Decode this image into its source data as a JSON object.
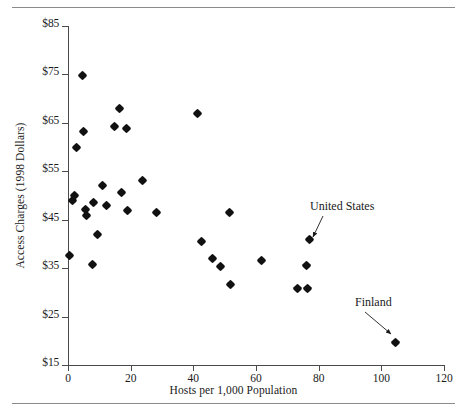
{
  "figure": {
    "has_top_rule": true,
    "has_bottom_rule": true,
    "background": "#ffffff",
    "marker_color": "#111111",
    "axis_color": "#4a4a4a",
    "rule_color": "#8a8a8a"
  },
  "chart_data": {
    "type": "scatter",
    "title": "",
    "xlabel": "Hosts per 1,000 Population",
    "ylabel": "Access Charges (1998 Dollars)",
    "xlim": [
      0,
      120
    ],
    "ylim": [
      15,
      85
    ],
    "xticks": [
      0,
      20,
      40,
      60,
      80,
      100,
      120
    ],
    "xtick_labels": [
      "0",
      "20",
      "40",
      "60",
      "80",
      "100",
      "120"
    ],
    "yticks": [
      15,
      25,
      35,
      45,
      55,
      65,
      75,
      85
    ],
    "ytick_labels": [
      "$15",
      "$25",
      "$35",
      "$45",
      "$55",
      "$65",
      "$75",
      "$85"
    ],
    "grid": false,
    "legend": null,
    "points": [
      {
        "x": 0.6,
        "y": 37.6
      },
      {
        "x": 1.3,
        "y": 48.9
      },
      {
        "x": 2.2,
        "y": 49.9
      },
      {
        "x": 2.6,
        "y": 60.0
      },
      {
        "x": 4.7,
        "y": 74.8
      },
      {
        "x": 5.1,
        "y": 63.2
      },
      {
        "x": 5.6,
        "y": 47.2
      },
      {
        "x": 5.8,
        "y": 45.9
      },
      {
        "x": 7.7,
        "y": 35.8
      },
      {
        "x": 8.0,
        "y": 48.5
      },
      {
        "x": 9.5,
        "y": 42.0
      },
      {
        "x": 11.0,
        "y": 52.1
      },
      {
        "x": 12.3,
        "y": 47.9
      },
      {
        "x": 14.7,
        "y": 64.3
      },
      {
        "x": 16.3,
        "y": 68.0
      },
      {
        "x": 17.1,
        "y": 50.6
      },
      {
        "x": 18.7,
        "y": 63.8
      },
      {
        "x": 19.1,
        "y": 46.8
      },
      {
        "x": 23.7,
        "y": 53.2
      },
      {
        "x": 28.2,
        "y": 46.5
      },
      {
        "x": 41.2,
        "y": 67.0
      },
      {
        "x": 42.5,
        "y": 40.6
      },
      {
        "x": 46.0,
        "y": 36.9
      },
      {
        "x": 48.7,
        "y": 35.4
      },
      {
        "x": 51.5,
        "y": 46.5
      },
      {
        "x": 52.0,
        "y": 31.6
      },
      {
        "x": 61.8,
        "y": 36.6
      },
      {
        "x": 73.4,
        "y": 30.7
      },
      {
        "x": 76.3,
        "y": 30.7
      },
      {
        "x": 76.0,
        "y": 35.6
      },
      {
        "x": 77.0,
        "y": 40.9
      },
      {
        "x": 104.4,
        "y": 19.6
      }
    ],
    "annotations": [
      {
        "label": "United States",
        "label_x": 310,
        "label_y": 200,
        "arrow_from_x": 323,
        "arrow_from_y": 216,
        "arrow_to_x": 313,
        "arrow_to_y": 237,
        "point_x": 77.0,
        "point_y": 40.9
      },
      {
        "label": "Finland",
        "label_x": 355,
        "label_y": 296,
        "arrow_from_x": 365,
        "arrow_from_y": 312,
        "arrow_to_x": 391,
        "arrow_to_y": 334,
        "point_x": 104.4,
        "point_y": 19.6
      }
    ]
  }
}
